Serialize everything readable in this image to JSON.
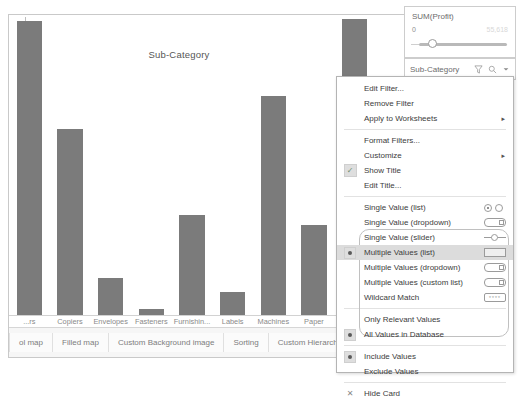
{
  "chart_data": {
    "type": "bar",
    "title": "Sub-Category",
    "xlabel": "",
    "ylabel": "",
    "categories": [
      "...rs",
      "Copiers",
      "Envelopes",
      "Fasteners",
      "Furnishin...",
      "Labels",
      "Machines",
      "Paper",
      "Phones"
    ],
    "values": [
      55.6,
      35.2,
      7.0,
      1.2,
      19.0,
      4.4,
      41.5,
      17.0,
      56.0
    ],
    "ylim": [
      0,
      56
    ],
    "grid": false,
    "legend": "none",
    "bar_color": "#7b7b7b"
  },
  "profit_card": {
    "title": "SUM(Profit)",
    "min_label": "0",
    "max_label": "55,618",
    "slider_name": "profit-range-slider"
  },
  "subcategory_card": {
    "title": "Sub-Category",
    "icons": [
      "filter-icon",
      "search-icon",
      "chevron-down-icon"
    ]
  },
  "context_menu": {
    "groups": [
      {
        "items": [
          {
            "label": "Edit Filter...",
            "gutter": "none",
            "submenu": false,
            "mode_icon": "none",
            "selected": false
          },
          {
            "label": "Remove Filter",
            "gutter": "none",
            "submenu": false,
            "mode_icon": "none",
            "selected": false
          },
          {
            "label": "Apply to Worksheets",
            "gutter": "none",
            "submenu": true,
            "mode_icon": "none",
            "selected": false
          }
        ]
      },
      {
        "items": [
          {
            "label": "Format Filters...",
            "gutter": "none",
            "submenu": false,
            "mode_icon": "none",
            "selected": false
          },
          {
            "label": "Customize",
            "gutter": "none",
            "submenu": true,
            "mode_icon": "none",
            "selected": false
          },
          {
            "label": "Show Title",
            "gutter": "check",
            "submenu": false,
            "mode_icon": "none",
            "selected": false
          },
          {
            "label": "Edit Title...",
            "gutter": "none",
            "submenu": false,
            "mode_icon": "none",
            "selected": false
          }
        ]
      },
      {
        "items": [
          {
            "label": "Single Value (list)",
            "gutter": "none",
            "submenu": false,
            "mode_icon": "radio-pair-icon",
            "selected": false
          },
          {
            "label": "Single Value (dropdown)",
            "gutter": "none",
            "submenu": false,
            "mode_icon": "dropdown-icon",
            "selected": false
          },
          {
            "label": "Single Value (slider)",
            "gutter": "none",
            "submenu": false,
            "mode_icon": "slider-icon",
            "selected": false
          },
          {
            "label": "Multiple Values (list)",
            "gutter": "radio",
            "submenu": false,
            "mode_icon": "list-icon",
            "selected": true
          },
          {
            "label": "Multiple Values (dropdown)",
            "gutter": "none",
            "submenu": false,
            "mode_icon": "dropdown-check-icon",
            "selected": false
          },
          {
            "label": "Multiple Values (custom list)",
            "gutter": "none",
            "submenu": false,
            "mode_icon": "dropdown-check-icon",
            "selected": false
          },
          {
            "label": "Wildcard Match",
            "gutter": "none",
            "submenu": false,
            "mode_icon": "wildcard-icon",
            "selected": false
          }
        ]
      },
      {
        "items": [
          {
            "label": "Only Relevant Values",
            "gutter": "none",
            "submenu": false,
            "mode_icon": "none",
            "selected": false
          },
          {
            "label": "All Values in Database",
            "gutter": "radio",
            "submenu": false,
            "mode_icon": "none",
            "selected": false
          }
        ]
      },
      {
        "items": [
          {
            "label": "Include Values",
            "gutter": "radio",
            "submenu": false,
            "mode_icon": "none",
            "selected": false
          },
          {
            "label": "Exclude Values",
            "gutter": "none",
            "submenu": false,
            "mode_icon": "none",
            "selected": false
          }
        ]
      },
      {
        "items": [
          {
            "label": "Hide Card",
            "gutter": "x",
            "submenu": false,
            "mode_icon": "none",
            "selected": false
          }
        ]
      }
    ]
  },
  "worksheet_tabs": [
    {
      "label": "ol map"
    },
    {
      "label": "Filled map"
    },
    {
      "label": "Custom Background image"
    },
    {
      "label": "Sorting"
    },
    {
      "label": "Custom Hierarchy"
    },
    {
      "label": "Group"
    }
  ]
}
